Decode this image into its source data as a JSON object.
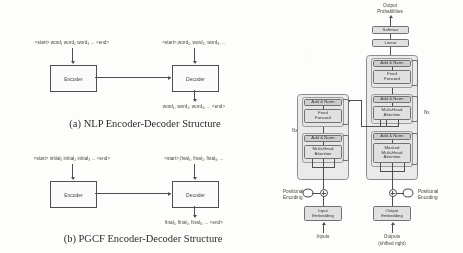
{
  "figure": {
    "kind": "paper-figure",
    "panels": [
      "nlp-encoder-decoder",
      "pgcf-encoder-decoder",
      "transformer-architecture"
    ]
  },
  "panel_a": {
    "caption": "(a) NLP Encoder-Decoder Structure",
    "encoder_label": "Encoder",
    "decoder_label": "Decoder",
    "encoder_input": "<start> word₁ word₂ word₃ ... <end>",
    "decoder_input": "<start>,word₁, word₂, word₃, ...",
    "decoder_output": "word₁, word₂, word₃, ... <end>"
  },
  "panel_b": {
    "caption": "(b) PGCF Encoder-Decoder Structure",
    "encoder_label": "Encoder",
    "decoder_label": "Decoder",
    "encoder_input": "<start> initial₁ initial₂ initial₃ ... <end>",
    "decoder_input": "<start>,final₁, final₂, final₃, ...",
    "decoder_output": "final₁, final₂, final₃, ... <end>"
  },
  "transformer": {
    "top_label": "Output\nProbabilities",
    "top_label_line1": "Output",
    "top_label_line2": "Probabilities",
    "softmax": "Softmax",
    "linear": "Linear",
    "add_norm": "Add & Norm",
    "feed_forward_line1": "Feed",
    "feed_forward_line2": "Forward",
    "multi_head_line1": "Multi-Head",
    "multi_head_line2": "Attention",
    "masked_line1": "Masked",
    "masked_line2": "Multi-Head",
    "masked_line3": "Attention",
    "input_embedding_line1": "Input",
    "input_embedding_line2": "Embedding",
    "output_embedding_line1": "Output",
    "output_embedding_line2": "Embedding",
    "positional_encoding_line1": "Positional",
    "positional_encoding_line2": "Encoding",
    "nx_left": "Nx",
    "nx_right": "Nx",
    "inputs": "Inputs",
    "outputs_line1": "Outputs",
    "outputs_line2": "(shifted right)"
  },
  "colors": {
    "page_background": "#fdfdfb",
    "ink": "#3a3a3a",
    "box_fill": "#e3e3e3",
    "norm_fill": "#cfcfcf",
    "frame": "#8a8a8a"
  }
}
